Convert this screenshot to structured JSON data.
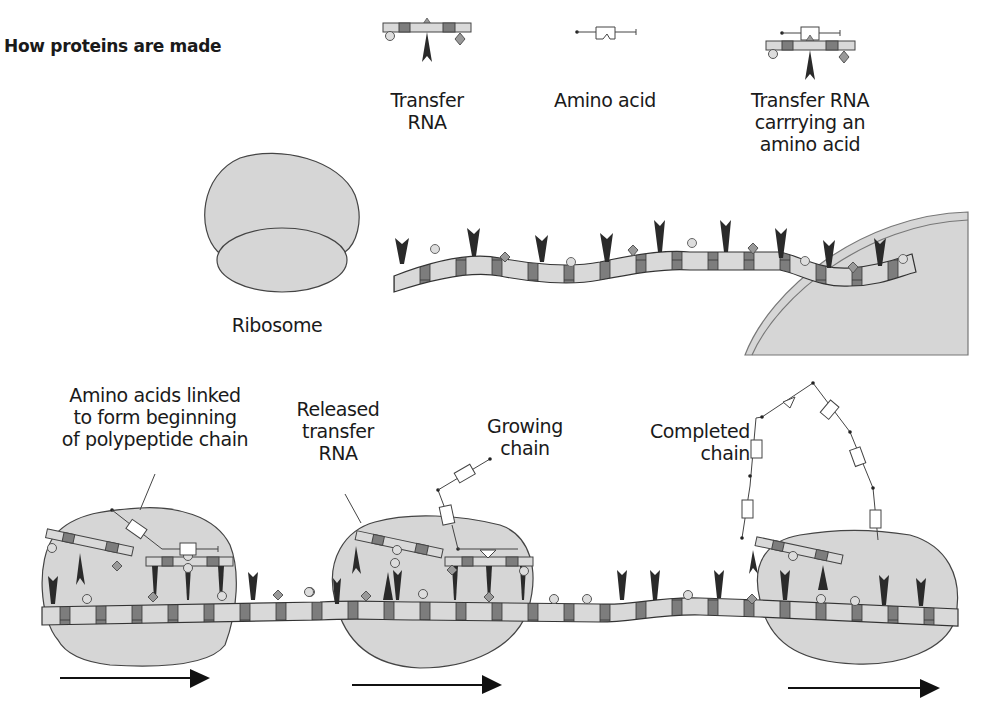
{
  "title": "How proteins are made",
  "legend": {
    "transfer_rna": {
      "line1": "Transfer",
      "line2": "RNA"
    },
    "amino_acid": {
      "line1": "Amino acid"
    },
    "trna_carrying": {
      "line1": "Transfer RNA",
      "line2": "carrrying an",
      "line3": "amino acid"
    }
  },
  "labels": {
    "ribosome": "Ribosome",
    "nucleus": "Nucleus",
    "amino_linked": {
      "line1": "Amino acids linked",
      "line2": "to form beginning",
      "line3": "of polypeptide chain"
    },
    "released": {
      "line1": "Released",
      "line2": "transfer",
      "line3": "RNA"
    },
    "growing": {
      "line1": "Growing",
      "line2": "chain"
    },
    "completed": {
      "line1": "Completed",
      "line2": "chain"
    }
  },
  "colors": {
    "ribosome_fill": "#d6d6d6",
    "strand_light": "#d9d9d9",
    "strand_dark": "#7d7d7d",
    "outline": "#3a3a3a",
    "arrow": "#111111"
  }
}
